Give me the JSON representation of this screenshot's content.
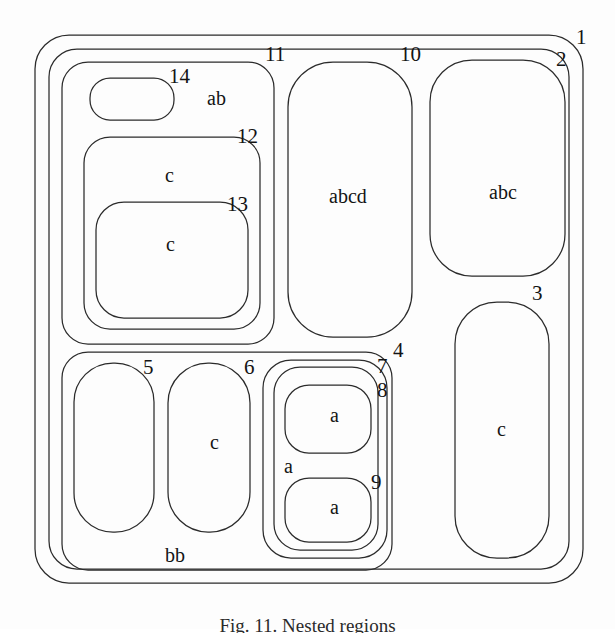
{
  "figure": {
    "caption": "Fig. 11. Nested regions",
    "stroke_color": "#2b2b2b",
    "background_color": "#fdfdfd"
  },
  "regions": [
    {
      "id": "1",
      "number_label": "1",
      "content_label": "",
      "shape": "rounded-rect",
      "x": 35,
      "y": 35,
      "w": 548,
      "h": 548,
      "r": 34
    },
    {
      "id": "2",
      "number_label": "2",
      "content_label": "",
      "shape": "rounded-rect",
      "x": 49,
      "y": 49,
      "w": 520,
      "h": 520,
      "r": 28
    },
    {
      "id": "11",
      "number_label": "11",
      "content_label": "",
      "shape": "rounded-rect",
      "x": 62,
      "y": 62,
      "w": 212,
      "h": 282,
      "r": 26
    },
    {
      "id": "14",
      "number_label": "14",
      "content_label": "ab",
      "shape": "rounded-rect",
      "x": 90,
      "y": 78,
      "w": 84,
      "h": 42,
      "r": 20
    },
    {
      "id": "12",
      "number_label": "12",
      "content_label": "c",
      "shape": "rounded-rect",
      "x": 84,
      "y": 137,
      "w": 176,
      "h": 192,
      "r": 26
    },
    {
      "id": "13",
      "number_label": "13",
      "content_label": "c",
      "shape": "rounded-rect",
      "x": 96,
      "y": 202,
      "w": 152,
      "h": 116,
      "r": 28
    },
    {
      "id": "10",
      "number_label": "10",
      "content_label": "abcd",
      "shape": "rounded-rect",
      "x": 288,
      "y": 62,
      "w": 124,
      "h": 275,
      "r": 45
    },
    {
      "id": "abc",
      "number_label": "",
      "content_label": "abc",
      "shape": "rounded-rect",
      "x": 430,
      "y": 60,
      "w": 135,
      "h": 216,
      "r": 42
    },
    {
      "id": "3",
      "number_label": "3",
      "content_label": "c",
      "shape": "rounded-rect",
      "x": 455,
      "y": 302,
      "w": 94,
      "h": 256,
      "r": 42
    },
    {
      "id": "bb",
      "number_label": "",
      "content_label": "bb",
      "shape": "rounded-rect",
      "x": 62,
      "y": 352,
      "w": 330,
      "h": 218,
      "r": 26
    },
    {
      "id": "5",
      "number_label": "5",
      "content_label": "",
      "shape": "rounded-rect",
      "x": 74,
      "y": 363,
      "w": 80,
      "h": 169,
      "r": 39
    },
    {
      "id": "6",
      "number_label": "6",
      "content_label": "c",
      "shape": "rounded-rect",
      "x": 168,
      "y": 363,
      "w": 82,
      "h": 169,
      "r": 40
    },
    {
      "id": "4",
      "number_label": "4",
      "content_label": "",
      "shape": "rounded-rect",
      "x": 263,
      "y": 360,
      "w": 124,
      "h": 198,
      "r": 28
    },
    {
      "id": "7",
      "number_label": "7",
      "content_label": "a",
      "shape": "rounded-rect",
      "x": 274,
      "y": 367,
      "w": 104,
      "h": 183,
      "r": 26
    },
    {
      "id": "8",
      "number_label": "8",
      "content_label": "a",
      "shape": "rounded-rect",
      "x": 285,
      "y": 385,
      "w": 86,
      "h": 68,
      "r": 24
    },
    {
      "id": "9",
      "number_label": "9",
      "content_label": "a",
      "shape": "rounded-rect",
      "x": 285,
      "y": 478,
      "w": 86,
      "h": 64,
      "r": 24
    }
  ],
  "number_labels": [
    {
      "text": "1",
      "x": 576,
      "y": 27
    },
    {
      "text": "2",
      "x": 556,
      "y": 49
    },
    {
      "text": "11",
      "x": 265,
      "y": 44
    },
    {
      "text": "10",
      "x": 400,
      "y": 44
    },
    {
      "text": "14",
      "x": 169,
      "y": 66
    },
    {
      "text": "12",
      "x": 237,
      "y": 126
    },
    {
      "text": "13",
      "x": 227,
      "y": 194
    },
    {
      "text": "3",
      "x": 532,
      "y": 283
    },
    {
      "text": "4",
      "x": 393,
      "y": 340
    },
    {
      "text": "7",
      "x": 377,
      "y": 356
    },
    {
      "text": "8",
      "x": 377,
      "y": 380
    },
    {
      "text": "5",
      "x": 143,
      "y": 357
    },
    {
      "text": "6",
      "x": 244,
      "y": 357
    },
    {
      "text": "9",
      "x": 371,
      "y": 472
    }
  ],
  "content_labels": [
    {
      "text": "ab",
      "x": 207,
      "y": 88
    },
    {
      "text": "c",
      "x": 165,
      "y": 165
    },
    {
      "text": "c",
      "x": 166,
      "y": 234
    },
    {
      "text": "abcd",
      "x": 329,
      "y": 186
    },
    {
      "text": "abc",
      "x": 489,
      "y": 182
    },
    {
      "text": "c",
      "x": 497,
      "y": 419
    },
    {
      "text": "c",
      "x": 210,
      "y": 432
    },
    {
      "text": "a",
      "x": 330,
      "y": 405
    },
    {
      "text": "a",
      "x": 284,
      "y": 456
    },
    {
      "text": "a",
      "x": 330,
      "y": 497
    },
    {
      "text": "bb",
      "x": 165,
      "y": 545
    }
  ]
}
